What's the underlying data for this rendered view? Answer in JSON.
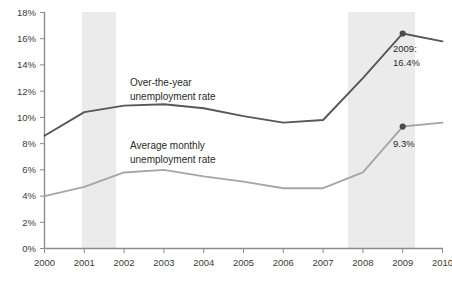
{
  "chart_data": {
    "type": "line",
    "title": "",
    "subtitle": "",
    "xlabel": "",
    "ylabel": "",
    "x": [
      2000,
      2001,
      2002,
      2003,
      2004,
      2005,
      2006,
      2007,
      2008,
      2009,
      2010
    ],
    "xtick_labels": [
      "2000",
      "2001",
      "2002",
      "2003",
      "2004",
      "2005",
      "2006",
      "2007",
      "2008",
      "2009",
      "2010"
    ],
    "ytick_labels": [
      "0%",
      "2%",
      "4%",
      "6%",
      "8%",
      "10%",
      "12%",
      "14%",
      "16%",
      "18%"
    ],
    "ytick_values": [
      0,
      2,
      4,
      6,
      8,
      10,
      12,
      14,
      16,
      18
    ],
    "ylim": [
      0,
      18
    ],
    "xlim": [
      2000,
      2010
    ],
    "grid": false,
    "legend_position": "inline-labels",
    "series": [
      {
        "name": "Over-the-year unemployment rate",
        "label": "Over-the-year\nunemployment rate",
        "label_line_1": "Over-the-year",
        "label_line_2": "unemployment rate",
        "color": "#575757",
        "values": [
          8.6,
          10.4,
          10.9,
          11.0,
          10.7,
          10.1,
          9.6,
          9.8,
          13.0,
          16.4,
          15.8
        ]
      },
      {
        "name": "Average monthly unemployment rate",
        "label": "Average monthly\nunemployment rate",
        "label_line_1": "Average monthly",
        "label_line_2": "unemployment rate",
        "color": "#a6a6a6",
        "values": [
          4.0,
          4.7,
          5.8,
          6.0,
          5.5,
          5.1,
          4.6,
          4.6,
          5.8,
          9.3,
          9.6
        ]
      }
    ],
    "annotations": [
      {
        "name": "peak-2009-over-the-year",
        "line_1": "2009:",
        "line_2": "16.4%",
        "x": 2009,
        "y": 16.4,
        "series": "Over-the-year unemployment rate"
      },
      {
        "name": "peak-2009-average-monthly",
        "line_1": "9.3%",
        "x": 2009,
        "y": 9.3,
        "series": "Average monthly unemployment rate"
      }
    ],
    "shaded_bands": [
      {
        "name": "recession-band-2001",
        "from": 2001.2,
        "to": 2002.0,
        "color": "#ebebeb"
      },
      {
        "name": "recession-band-2008",
        "from": 2007.9,
        "to": 2009.5,
        "color": "#ebebeb"
      }
    ],
    "axis_color": "#8c8c8c"
  }
}
